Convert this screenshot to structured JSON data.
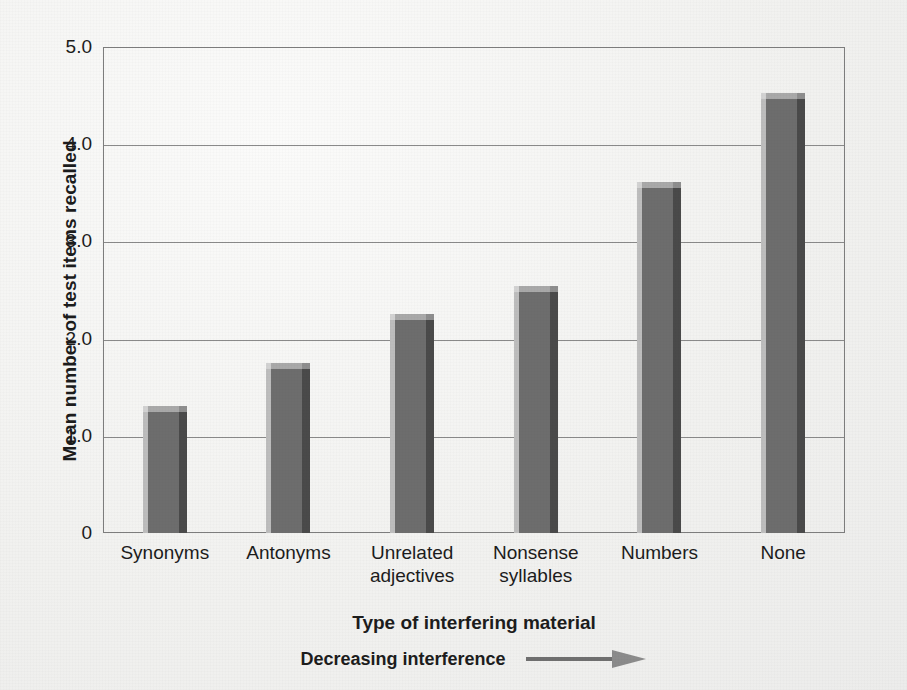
{
  "chart_data": {
    "type": "bar",
    "title": "",
    "xlabel": "Type of interfering material",
    "ylabel": "Mean number of test items recalled",
    "categories": [
      "Synonyms",
      "Antonyms",
      "Unrelated adjectives",
      "Nonsense syllables",
      "Numbers",
      "None"
    ],
    "category_lines": [
      [
        "Synonyms"
      ],
      [
        "Antonyms"
      ],
      [
        "Unrelated",
        "adjectives"
      ],
      [
        "Nonsense",
        "syllables"
      ],
      [
        "Numbers"
      ],
      [
        "None"
      ]
    ],
    "values": [
      1.25,
      1.69,
      2.19,
      2.48,
      3.55,
      4.47
    ],
    "ylim": [
      0,
      5.0
    ],
    "ytick_labels": [
      "5.0",
      "4.0",
      "3.0",
      "2.0",
      "1.0",
      "0"
    ],
    "ytick_values": [
      5.0,
      4.0,
      3.0,
      2.0,
      1.0,
      0
    ],
    "grid": "horizontal",
    "legend": "none",
    "annotation": "Decreasing interference",
    "annotation_arrow": "right-arrow-icon",
    "bar_color": "#6d6d6d",
    "bar_highlight_color": "#bdbdbd",
    "bar_shadow_color": "#4a4a4a",
    "grid_color": "#8a8a8a",
    "frame_color": "#7d7d7d",
    "background_color": "#f1f1ef",
    "text_color": "#1c1c1c"
  }
}
